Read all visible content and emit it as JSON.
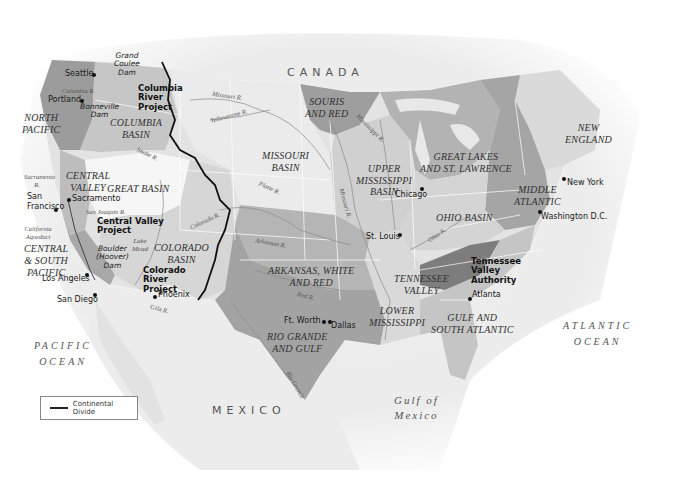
{
  "map": {
    "countries": [
      "CANADA",
      "MEXICO"
    ],
    "oceans": {
      "pacific": [
        "PACIFIC",
        "OCEAN"
      ],
      "atlantic": [
        "ATLANTIC",
        "OCEAN"
      ],
      "gulf": [
        "Gulf of",
        "Mexico"
      ]
    },
    "basins": [
      {
        "id": "north-pacific",
        "lines": [
          "NORTH",
          "PACIFIC"
        ]
      },
      {
        "id": "columbia-basin",
        "lines": [
          "COLUMBIA",
          "BASIN"
        ]
      },
      {
        "id": "central-valley",
        "lines": [
          "CENTRAL",
          "VALLEY"
        ]
      },
      {
        "id": "great-basin",
        "lines": [
          "GREAT BASIN"
        ]
      },
      {
        "id": "central-south-pacific",
        "lines": [
          "CENTRAL",
          "& SOUTH",
          "PACIFIC"
        ]
      },
      {
        "id": "colorado-basin",
        "lines": [
          "COLORADO",
          "BASIN"
        ]
      },
      {
        "id": "missouri-basin",
        "lines": [
          "MISSOURI",
          "BASIN"
        ]
      },
      {
        "id": "souris-and-red",
        "lines": [
          "SOURIS",
          "AND RED"
        ]
      },
      {
        "id": "upper-mississippi",
        "lines": [
          "UPPER",
          "MISSISSIPPI",
          "BASIN"
        ]
      },
      {
        "id": "great-lakes",
        "lines": [
          "GREAT LAKES",
          "AND ST. LAWRENCE"
        ]
      },
      {
        "id": "new-england",
        "lines": [
          "NEW",
          "ENGLAND"
        ]
      },
      {
        "id": "middle-atlantic",
        "lines": [
          "MIDDLE",
          "ATLANTIC"
        ]
      },
      {
        "id": "ohio-basin",
        "lines": [
          "OHIO BASIN"
        ]
      },
      {
        "id": "arkansas-white-red",
        "lines": [
          "ARKANSAS, WHITE",
          "AND RED"
        ]
      },
      {
        "id": "tennessee-valley",
        "lines": [
          "TENNESSEE",
          "VALLEY"
        ]
      },
      {
        "id": "lower-mississippi",
        "lines": [
          "LOWER",
          "MISSISSIPPI"
        ]
      },
      {
        "id": "rio-grande-gulf",
        "lines": [
          "RIO GRANDE",
          "AND GULF"
        ]
      },
      {
        "id": "gulf-south-atlantic",
        "lines": [
          "GULF AND",
          "SOUTH ATLANTIC"
        ]
      }
    ],
    "cities": [
      "Seattle",
      "Portland",
      "San Francisco",
      "Sacramento",
      "Los Angeles",
      "San Diego",
      "Phoenix",
      "Ft. Worth",
      "Dallas",
      "St. Louis",
      "Chicago",
      "Atlanta",
      "New York",
      "Washington D.C."
    ],
    "projects": [
      {
        "id": "columbia-river-project",
        "lines": [
          "Columbia",
          "River",
          "Project"
        ]
      },
      {
        "id": "central-valley-project",
        "lines": [
          "Central Valley",
          "Project"
        ]
      },
      {
        "id": "colorado-river-project",
        "lines": [
          "Colorado",
          "River",
          "Project"
        ]
      },
      {
        "id": "tennessee-valley-authority",
        "lines": [
          "Tennessee",
          "Valley",
          "Authority"
        ]
      }
    ],
    "dams": [
      {
        "id": "grand-coulee-dam",
        "lines": [
          "Grand",
          "Coulee",
          "Dam"
        ]
      },
      {
        "id": "bonneville-dam",
        "lines": [
          "Bonneville",
          "Dam"
        ]
      },
      {
        "id": "boulder-hoover-dam",
        "lines": [
          "Boulder",
          "(Hoover)",
          "Dam"
        ]
      }
    ],
    "rivers": [
      "Columbia R.",
      "Missouri R.",
      "Yellowstone R.",
      "Snake R.",
      "Sacramento R.",
      "San Joaquin R.",
      "California Aqueduct",
      "Lake Mead",
      "Colorado R.",
      "Gila R.",
      "Platte R.",
      "Missouri R.",
      "Mississippi R.",
      "Arkansas R.",
      "Red R.",
      "Ohio R.",
      "Rio Grande"
    ],
    "legend": {
      "label": "Continental Divide"
    },
    "colors": {
      "land_light": "#e6e6e6",
      "land_mid": "#cfcfcf",
      "land_dark": "#a9a9a9",
      "land_darker": "#8f8f8f",
      "great_basin": "#f4f4f4",
      "divide": "#111111",
      "border": "#ffffff"
    }
  }
}
